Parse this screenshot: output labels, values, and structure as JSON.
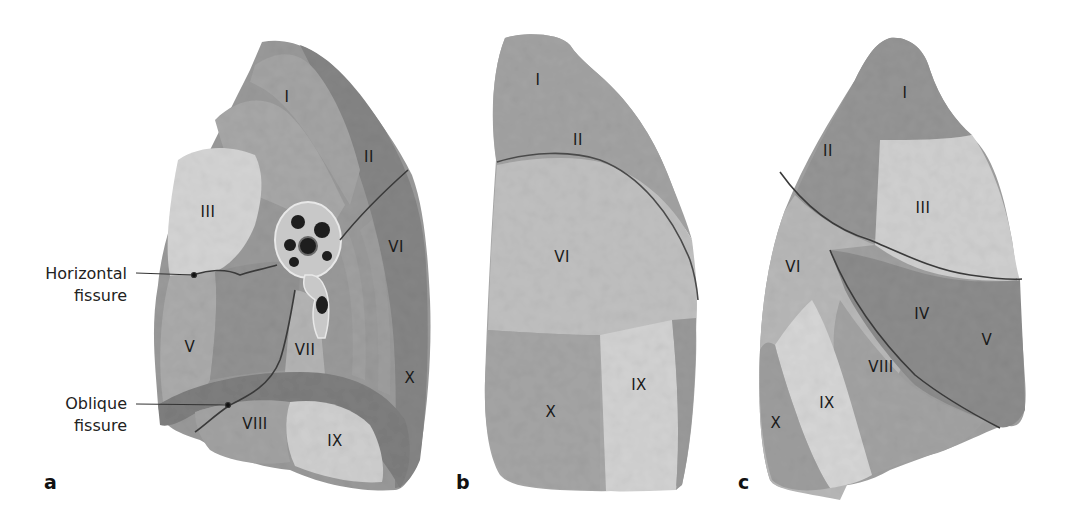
{
  "figure": {
    "panels": [
      {
        "id": "a",
        "label": "a",
        "view": "medial",
        "segments": [
          "I",
          "II",
          "III",
          "V",
          "VI",
          "VII",
          "VIII",
          "IX",
          "X"
        ],
        "callouts": [
          {
            "line1": "Horizontal",
            "line2": "fissure"
          },
          {
            "line1": "Oblique",
            "line2": "fissure"
          }
        ]
      },
      {
        "id": "b",
        "label": "b",
        "view": "posterior",
        "segments": [
          "I",
          "II",
          "VI",
          "IX",
          "X"
        ]
      },
      {
        "id": "c",
        "label": "c",
        "view": "lateral",
        "segments": [
          "I",
          "II",
          "III",
          "IV",
          "V",
          "VI",
          "VIII",
          "IX",
          "X"
        ]
      }
    ],
    "colors": {
      "background": "#ffffff",
      "lung_dark": "#8a8a8a",
      "lung_mid": "#a6a6a6",
      "lung_light": "#c8c8c8",
      "lung_highlight": "#dcdcdc",
      "fissure": "#3a3a3a",
      "text": "#1a1a1a"
    }
  }
}
